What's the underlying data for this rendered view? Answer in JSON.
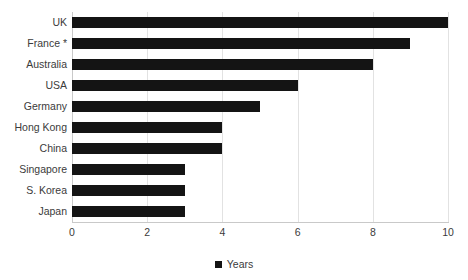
{
  "chart_data": {
    "type": "bar",
    "orientation": "horizontal",
    "title": "",
    "subtitle": "",
    "xlabel": "",
    "ylabel": "",
    "categories": [
      "UK",
      "France *",
      "Australia",
      "USA",
      "Germany",
      "Hong Kong",
      "China",
      "Singapore",
      "S. Korea",
      "Japan"
    ],
    "values": [
      10,
      9,
      8,
      6,
      5,
      4,
      4,
      3,
      3,
      3
    ],
    "series": [
      {
        "name": "Years",
        "values": [
          10,
          9,
          8,
          6,
          5,
          4,
          4,
          3,
          3,
          3
        ]
      }
    ],
    "xlim": [
      0,
      10
    ],
    "ylim": null,
    "xticks": [
      0,
      2,
      4,
      6,
      8,
      10
    ],
    "xtick_labels": [
      "0",
      "2",
      "4",
      "6",
      "8",
      "10"
    ],
    "grid": "vertical",
    "legend": {
      "position": "bottom-center",
      "entries": [
        {
          "label": "Years",
          "color": "#141414",
          "marker": "square"
        }
      ]
    },
    "colors": {
      "bar": "#141414",
      "grid": "#e2e2e2",
      "axis": "#c9c9c9",
      "text": "#3b3b3b",
      "background": "#ffffff"
    },
    "annotations": [
      "France * — asterisk footnote marker on category label"
    ]
  }
}
